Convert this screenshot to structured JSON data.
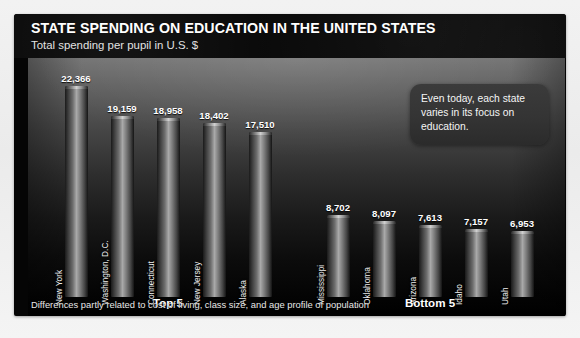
{
  "header": {
    "title": "STATE SPENDING ON EDUCATION IN THE UNITED STATES",
    "subtitle": "Total spending per pupil in U.S. $"
  },
  "callout": {
    "text": "Even today, each state varies in its focus on education."
  },
  "groups": {
    "top_label": "Top 5",
    "bottom_label": "Bottom 5"
  },
  "footnote": "Differences partly related to cost of living, class size, and age profile of population",
  "colors": {
    "panel_background": "#050505",
    "header_background": "#0a0a0a",
    "bar_highlight": "#a9a9a9",
    "bar_shadow": "#141414",
    "callout_background": "#343434",
    "text_primary": "#ffffff",
    "outer_background": "#eeeeee"
  },
  "chart_data": {
    "type": "bar",
    "title": "STATE SPENDING ON EDUCATION IN THE UNITED STATES",
    "subtitle": "Total spending per pupil in U.S. $",
    "xlabel": "",
    "ylabel": "Total spending per pupil in U.S. $",
    "ylim": [
      0,
      22366
    ],
    "grid": false,
    "legend": "none",
    "categories": [
      "New York",
      "Washington, D.C.",
      "Connecticut",
      "New Jersey",
      "Alaska",
      "Mississippi",
      "Oklahoma",
      "Arizona",
      "Idaho",
      "Utah"
    ],
    "values": [
      22366,
      19159,
      18958,
      18402,
      17510,
      8702,
      8097,
      7613,
      7157,
      6953
    ],
    "value_labels": [
      "22,366",
      "19,159",
      "18,958",
      "18,402",
      "17,510",
      "8,702",
      "8,097",
      "7,613",
      "7,157",
      "6,953"
    ],
    "groups": [
      {
        "label": "Top 5",
        "categories": [
          "New York",
          "Washington, D.C.",
          "Connecticut",
          "New Jersey",
          "Alaska"
        ]
      },
      {
        "label": "Bottom 5",
        "categories": [
          "Mississippi",
          "Oklahoma",
          "Arizona",
          "Idaho",
          "Utah"
        ]
      }
    ],
    "annotations": [
      "Even today, each state varies in its focus on education.",
      "Differences partly related to cost of living, class size, and age profile of population"
    ]
  }
}
